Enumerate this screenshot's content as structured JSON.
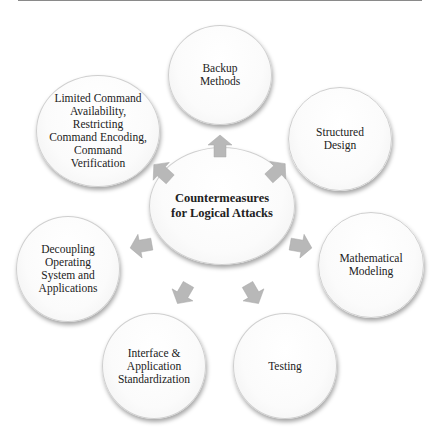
{
  "diagram": {
    "type": "radial-cycle",
    "center": {
      "label": "Countermeasures\nfor Logical Attacks"
    },
    "nodes": [
      {
        "id": "backup-methods",
        "label": "Backup\nMethods"
      },
      {
        "id": "structured-design",
        "label": "Structured\nDesign"
      },
      {
        "id": "mathematical-modeling",
        "label": "Mathematical\nModeling"
      },
      {
        "id": "testing",
        "label": "Testing"
      },
      {
        "id": "interface-standardization",
        "label": "Interface &\nApplication\nStandardization"
      },
      {
        "id": "decoupling",
        "label": "Decoupling\nOperating\nSystem and\nApplications"
      },
      {
        "id": "limited-command",
        "label": "Limited Command\nAvailability,\nRestricting\nCommand Encoding,\nCommand\nVerification"
      }
    ],
    "colors": {
      "arrow": "#b8b8b8",
      "node_border": "#cfcfcf",
      "text": "#222222"
    }
  }
}
